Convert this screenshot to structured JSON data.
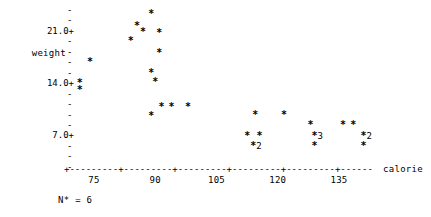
{
  "chart_data": {
    "type": "scatter",
    "title": "",
    "xlabel": "calorie",
    "ylabel": "weight",
    "plot_style": "character-scatterplot",
    "point_marker": "*",
    "xlim": [
      67.5,
      142.5
    ],
    "ylim": [
      1.75,
      24.5
    ],
    "xticks": [
      75,
      90,
      105,
      120,
      135
    ],
    "yticks": [
      7.0,
      14.0,
      21.0
    ],
    "ytick_labels": [
      "7.0+",
      "14.0+",
      "21.0+"
    ],
    "minor_tick_glyph": "-",
    "major_tick_glyph": "+",
    "grid": false,
    "legend": null,
    "footnote": "N* = 6",
    "missing_count": 6,
    "points": [
      {
        "x": 89.0,
        "y": 22.7,
        "n": 1,
        "label": ""
      },
      {
        "x": 85.5,
        "y": 21.2,
        "n": 1,
        "label": ""
      },
      {
        "x": 87.0,
        "y": 20.3,
        "n": 1,
        "label": ""
      },
      {
        "x": 91.0,
        "y": 20.2,
        "n": 1,
        "label": ""
      },
      {
        "x": 84.0,
        "y": 19.2,
        "n": 1,
        "label": ""
      },
      {
        "x": 91.0,
        "y": 17.5,
        "n": 1,
        "label": ""
      },
      {
        "x": 74.0,
        "y": 16.3,
        "n": 1,
        "label": ""
      },
      {
        "x": 89.0,
        "y": 14.9,
        "n": 1,
        "label": ""
      },
      {
        "x": 90.0,
        "y": 13.7,
        "n": 1,
        "label": ""
      },
      {
        "x": 71.5,
        "y": 13.6,
        "n": 1,
        "label": ""
      },
      {
        "x": 71.5,
        "y": 12.6,
        "n": 1,
        "label": ""
      },
      {
        "x": 91.5,
        "y": 10.4,
        "n": 1,
        "label": ""
      },
      {
        "x": 94.0,
        "y": 10.4,
        "n": 1,
        "label": ""
      },
      {
        "x": 98.0,
        "y": 10.4,
        "n": 1,
        "label": ""
      },
      {
        "x": 89.0,
        "y": 9.1,
        "n": 1,
        "label": ""
      },
      {
        "x": 114.5,
        "y": 9.3,
        "n": 1,
        "label": ""
      },
      {
        "x": 121.5,
        "y": 9.3,
        "n": 1,
        "label": ""
      },
      {
        "x": 128.0,
        "y": 8.0,
        "n": 1,
        "label": ""
      },
      {
        "x": 136.0,
        "y": 8.0,
        "n": 1,
        "label": ""
      },
      {
        "x": 138.5,
        "y": 8.0,
        "n": 1,
        "label": ""
      },
      {
        "x": 112.5,
        "y": 6.5,
        "n": 1,
        "label": ""
      },
      {
        "x": 115.5,
        "y": 6.5,
        "n": 1,
        "label": ""
      },
      {
        "x": 129.0,
        "y": 6.5,
        "n": 3,
        "label": "3"
      },
      {
        "x": 141.0,
        "y": 6.5,
        "n": 2,
        "label": "2"
      },
      {
        "x": 114.0,
        "y": 5.2,
        "n": 2,
        "label": "2"
      },
      {
        "x": 129.0,
        "y": 5.2,
        "n": 1,
        "label": ""
      },
      {
        "x": 141.0,
        "y": 5.2,
        "n": 1,
        "label": ""
      }
    ]
  },
  "axes": {
    "y": {
      "label": "weight",
      "ticks": [
        {
          "text": "-",
          "major": false
        },
        {
          "text": "-",
          "major": false
        },
        {
          "text": "21.0+",
          "major": true
        },
        {
          "text": "-",
          "major": false
        },
        {
          "text": "-",
          "major": false
        },
        {
          "text": "-",
          "major": false
        },
        {
          "text": "-",
          "major": false
        },
        {
          "text": "14.0+",
          "major": true
        },
        {
          "text": "-",
          "major": false
        },
        {
          "text": "-",
          "major": false
        },
        {
          "text": "-",
          "major": false
        },
        {
          "text": "-",
          "major": false
        },
        {
          "text": "7.0+",
          "major": true
        },
        {
          "text": "-",
          "major": false
        },
        {
          "text": "-",
          "major": false
        },
        {
          "text": "-",
          "major": false
        }
      ]
    },
    "x": {
      "title": "calorie",
      "line": "+---------+---------+---------+---------+---------+------",
      "tick_labels": [
        "75",
        "90",
        "105",
        "120",
        "135"
      ]
    }
  },
  "footnote": {
    "text": "N* = 6"
  }
}
